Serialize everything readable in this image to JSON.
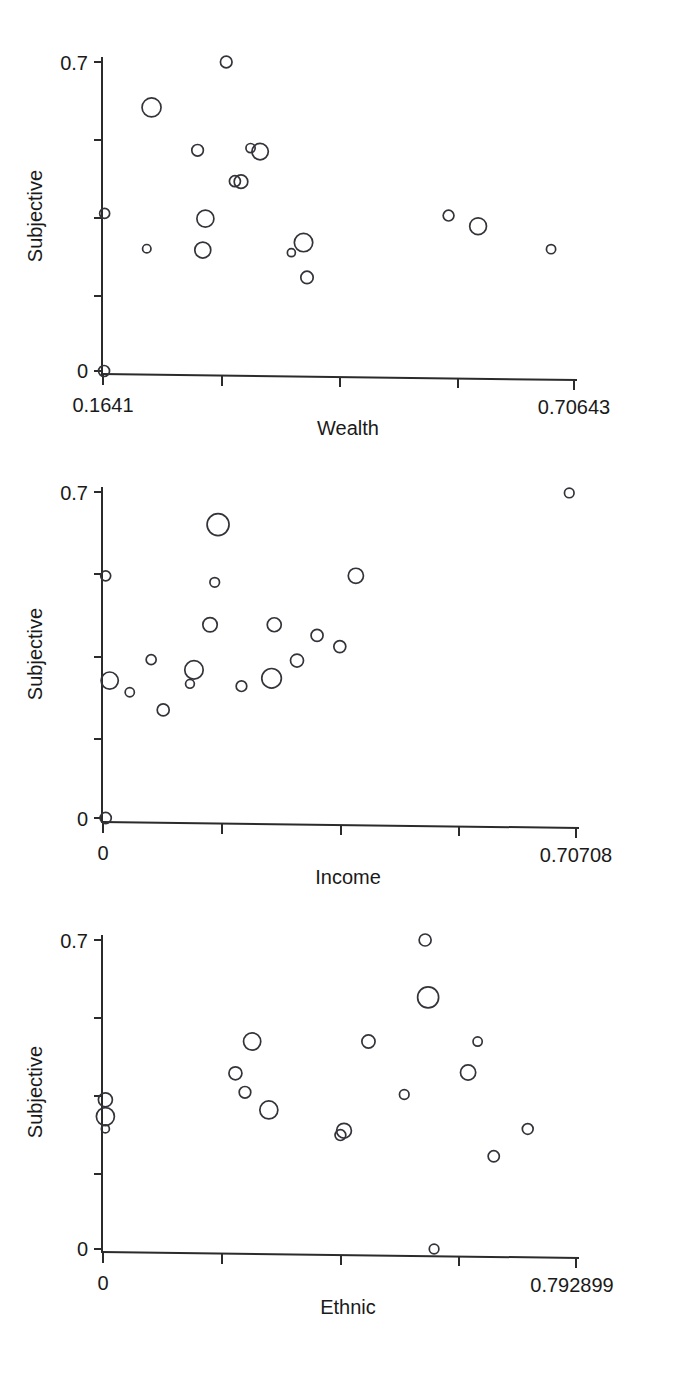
{
  "figure": {
    "kind": "scatter-matrix-column",
    "panel_count": 3,
    "marker_style": "open-circle",
    "marker_color": "#33333a",
    "background_color": "#ffffff",
    "axis_color": "#2b2b2b"
  },
  "panels": [
    {
      "name": "wealth-panel",
      "ylabel": "Subjective",
      "xlabel": "Wealth",
      "y_tick_labels": [
        "0.7",
        "0"
      ],
      "x_tick_labels": [
        "0.1641",
        "0.70643"
      ]
    },
    {
      "name": "income-panel",
      "ylabel": "Subjective",
      "xlabel": "Income",
      "y_tick_labels": [
        "0.7",
        "0"
      ],
      "x_tick_labels": [
        "0",
        "0.70708"
      ]
    },
    {
      "name": "ethnic-panel",
      "ylabel": "Subjective",
      "xlabel": "Ethnic",
      "y_tick_labels": [
        "0.7",
        "0"
      ],
      "x_tick_labels": [
        "0",
        "0.792899"
      ]
    }
  ],
  "chart_data": [
    {
      "type": "scatter",
      "title": "",
      "xlabel": "Wealth",
      "ylabel": "Subjective",
      "xlim": [
        0.1641,
        0.70643
      ],
      "ylim": [
        0,
        0.7
      ],
      "x_tick_labels": [
        "0.1641",
        "0.70643"
      ],
      "y_tick_labels": [
        "0",
        "0.7"
      ],
      "x_ticks": [
        0.1641,
        0.2998,
        0.4354,
        0.5711,
        0.70643
      ],
      "y_ticks": [
        0,
        0.175,
        0.35,
        0.525,
        0.7
      ],
      "grid": false,
      "legend": null,
      "marker": "open-circle",
      "size_encodes": "weight",
      "points": [
        {
          "x": 0.1653,
          "y": 0.0,
          "r": 5.5
        },
        {
          "x": 0.166,
          "y": 0.357,
          "r": 5.0
        },
        {
          "x": 0.2145,
          "y": 0.277,
          "r": 4.2
        },
        {
          "x": 0.22,
          "y": 0.597,
          "r": 9.5
        },
        {
          "x": 0.273,
          "y": 0.5,
          "r": 5.8
        },
        {
          "x": 0.279,
          "y": 0.274,
          "r": 8.0
        },
        {
          "x": 0.282,
          "y": 0.345,
          "r": 8.5
        },
        {
          "x": 0.306,
          "y": 0.7,
          "r": 5.8
        },
        {
          "x": 0.316,
          "y": 0.43,
          "r": 5.5
        },
        {
          "x": 0.323,
          "y": 0.429,
          "r": 6.8
        },
        {
          "x": 0.334,
          "y": 0.505,
          "r": 4.6
        },
        {
          "x": 0.345,
          "y": 0.497,
          "r": 8.2
        },
        {
          "x": 0.381,
          "y": 0.268,
          "r": 4.0
        },
        {
          "x": 0.395,
          "y": 0.291,
          "r": 9.2
        },
        {
          "x": 0.399,
          "y": 0.212,
          "r": 6.2
        },
        {
          "x": 0.562,
          "y": 0.352,
          "r": 5.4
        },
        {
          "x": 0.596,
          "y": 0.328,
          "r": 8.4
        },
        {
          "x": 0.68,
          "y": 0.276,
          "r": 4.6
        }
      ]
    },
    {
      "type": "scatter",
      "title": "",
      "xlabel": "Income",
      "ylabel": "Subjective",
      "xlim": [
        0,
        0.70708
      ],
      "ylim": [
        0,
        0.7
      ],
      "x_tick_labels": [
        "0",
        "0.70708"
      ],
      "y_tick_labels": [
        "0",
        "0.7"
      ],
      "x_ticks": [
        0,
        0.177,
        0.354,
        0.53,
        0.70708
      ],
      "y_ticks": [
        0,
        0.175,
        0.35,
        0.525,
        0.7
      ],
      "grid": false,
      "legend": null,
      "marker": "open-circle",
      "size_encodes": "weight",
      "points": [
        {
          "x": 0.004,
          "y": 0.0,
          "r": 5.6
        },
        {
          "x": 0.004,
          "y": 0.52,
          "r": 5.0
        },
        {
          "x": 0.01,
          "y": 0.295,
          "r": 8.6
        },
        {
          "x": 0.04,
          "y": 0.27,
          "r": 4.6
        },
        {
          "x": 0.072,
          "y": 0.34,
          "r": 5.0
        },
        {
          "x": 0.09,
          "y": 0.232,
          "r": 6.0
        },
        {
          "x": 0.13,
          "y": 0.288,
          "r": 4.4
        },
        {
          "x": 0.136,
          "y": 0.318,
          "r": 9.2
        },
        {
          "x": 0.16,
          "y": 0.415,
          "r": 7.2
        },
        {
          "x": 0.167,
          "y": 0.506,
          "r": 4.8
        },
        {
          "x": 0.172,
          "y": 0.63,
          "r": 11.0
        },
        {
          "x": 0.207,
          "y": 0.283,
          "r": 5.3
        },
        {
          "x": 0.252,
          "y": 0.3,
          "r": 9.8
        },
        {
          "x": 0.256,
          "y": 0.415,
          "r": 7.0
        },
        {
          "x": 0.29,
          "y": 0.338,
          "r": 6.5
        },
        {
          "x": 0.32,
          "y": 0.392,
          "r": 6.0
        },
        {
          "x": 0.354,
          "y": 0.368,
          "r": 6.0
        },
        {
          "x": 0.378,
          "y": 0.52,
          "r": 7.6
        },
        {
          "x": 0.697,
          "y": 0.698,
          "r": 4.8
        }
      ]
    },
    {
      "type": "scatter",
      "title": "",
      "xlabel": "Ethnic",
      "ylabel": "Subjective",
      "xlim": [
        0,
        0.792899
      ],
      "ylim": [
        0,
        0.7
      ],
      "x_tick_labels": [
        "0",
        "0.792899"
      ],
      "y_tick_labels": [
        "0",
        "0.7"
      ],
      "x_ticks": [
        0,
        0.1982,
        0.3964,
        0.5947,
        0.792899
      ],
      "y_ticks": [
        0,
        0.175,
        0.35,
        0.525,
        0.7
      ],
      "grid": false,
      "legend": null,
      "marker": "open-circle",
      "size_encodes": "weight",
      "points": [
        {
          "x": 0.004,
          "y": 0.338,
          "r": 7.0
        },
        {
          "x": 0.004,
          "y": 0.3,
          "r": 9.0
        },
        {
          "x": 0.004,
          "y": 0.272,
          "r": 4.0
        },
        {
          "x": 0.222,
          "y": 0.398,
          "r": 6.5
        },
        {
          "x": 0.238,
          "y": 0.355,
          "r": 5.8
        },
        {
          "x": 0.25,
          "y": 0.47,
          "r": 8.6
        },
        {
          "x": 0.278,
          "y": 0.315,
          "r": 9.0
        },
        {
          "x": 0.398,
          "y": 0.258,
          "r": 5.4
        },
        {
          "x": 0.404,
          "y": 0.268,
          "r": 7.4
        },
        {
          "x": 0.445,
          "y": 0.47,
          "r": 6.6
        },
        {
          "x": 0.505,
          "y": 0.35,
          "r": 4.8
        },
        {
          "x": 0.54,
          "y": 0.7,
          "r": 6.0
        },
        {
          "x": 0.545,
          "y": 0.57,
          "r": 10.5
        },
        {
          "x": 0.555,
          "y": 0.0,
          "r": 4.8
        },
        {
          "x": 0.612,
          "y": 0.4,
          "r": 7.6
        },
        {
          "x": 0.628,
          "y": 0.47,
          "r": 4.6
        },
        {
          "x": 0.655,
          "y": 0.21,
          "r": 5.6
        },
        {
          "x": 0.712,
          "y": 0.272,
          "r": 5.4
        }
      ]
    }
  ]
}
